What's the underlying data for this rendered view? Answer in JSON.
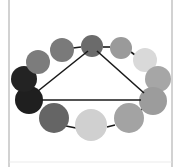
{
  "diagram": {
    "type": "ring-of-circles-with-triangle",
    "frame": {
      "left_x": 9,
      "right_x": 172,
      "bottom_y": 162,
      "color": "#b4b4b4"
    },
    "line_color": "#1a1a1a",
    "circles": [
      {
        "id": "top-center",
        "cx": 92,
        "cy": 46,
        "r": 11,
        "fill": "#6b6b6b"
      },
      {
        "id": "upper-right-1",
        "cx": 121,
        "cy": 48,
        "r": 11,
        "fill": "#9a9a9a"
      },
      {
        "id": "upper-right-2",
        "cx": 145,
        "cy": 60,
        "r": 12,
        "fill": "#d9d9d9"
      },
      {
        "id": "right-upper",
        "cx": 158,
        "cy": 79,
        "r": 13,
        "fill": "#a6a6a6"
      },
      {
        "id": "right-lower",
        "cx": 153,
        "cy": 101,
        "r": 14,
        "fill": "#9c9c9c"
      },
      {
        "id": "bottom-right",
        "cx": 129,
        "cy": 118,
        "r": 15,
        "fill": "#a3a3a3"
      },
      {
        "id": "bottom-center",
        "cx": 91,
        "cy": 125,
        "r": 16,
        "fill": "#d0d0d0"
      },
      {
        "id": "bottom-left",
        "cx": 54,
        "cy": 118,
        "r": 15,
        "fill": "#656565"
      },
      {
        "id": "left-lower-dark",
        "cx": 29,
        "cy": 100,
        "r": 14,
        "fill": "#1f1f1f"
      },
      {
        "id": "left-upper-dark",
        "cx": 24,
        "cy": 79,
        "r": 13,
        "fill": "#232323"
      },
      {
        "id": "upper-left-2",
        "cx": 38,
        "cy": 62,
        "r": 12,
        "fill": "#7c7c7c"
      },
      {
        "id": "upper-left-1",
        "cx": 62,
        "cy": 50,
        "r": 12,
        "fill": "#7a7a7a"
      }
    ],
    "ring_links": [
      {
        "x1": 73,
        "y1": 48,
        "x2": 81,
        "y2": 47
      },
      {
        "x1": 103,
        "y1": 47,
        "x2": 110,
        "y2": 47
      },
      {
        "x1": 131,
        "y1": 52,
        "x2": 135,
        "y2": 55
      },
      {
        "x1": 66,
        "y1": 126,
        "x2": 76,
        "y2": 128
      },
      {
        "x1": 107,
        "y1": 127,
        "x2": 115,
        "y2": 125
      },
      {
        "x1": 141,
        "y1": 110,
        "x2": 145,
        "y2": 107
      }
    ],
    "triangle": [
      {
        "x1": 88,
        "y1": 51,
        "x2": 38,
        "y2": 91
      },
      {
        "x1": 97,
        "y1": 51,
        "x2": 144,
        "y2": 93
      },
      {
        "x1": 42,
        "y1": 100,
        "x2": 141,
        "y2": 100
      }
    ]
  }
}
